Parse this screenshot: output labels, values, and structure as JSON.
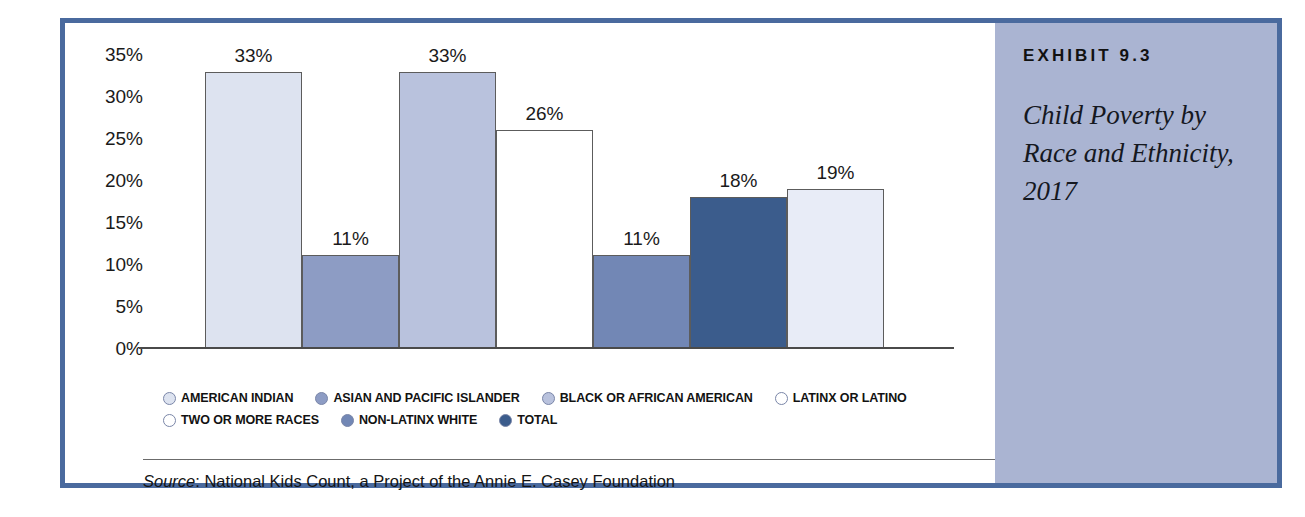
{
  "exhibit": {
    "label": "EXHIBIT 9.3",
    "title": "Child Poverty by Race and Ethnicity, 2017",
    "panel_color": "#aab4d2",
    "frame_color": "#4a6a9e"
  },
  "source": {
    "prefix": "Source",
    "separator": ": ",
    "text": "National Kids Count, a Project of the Annie E. Casey Foundation",
    "full": "Source: National Kids Count, a Project of the Annie E. Casey Foundation"
  },
  "legend": {
    "rows": [
      [
        {
          "label": "AMERICAN INDIAN",
          "color": "#dde3f0"
        },
        {
          "label": "ASIAN AND PACIFIC ISLANDER",
          "color": "#8d9cc4"
        },
        {
          "label": "BLACK OR AFRICAN AMERICAN",
          "color": "#b9c2dd"
        },
        {
          "label": "LATINX OR LATINO",
          "color": "#ffffff"
        }
      ],
      [
        {
          "label": "TWO OR MORE RACES",
          "color": "#ffffff"
        },
        {
          "label": "NON-LATINX WHITE",
          "color": "#7287b5"
        },
        {
          "label": "TOTAL",
          "color": "#3b5c8c"
        }
      ]
    ]
  },
  "chart_data": {
    "type": "bar",
    "title": "Child Poverty by Race and Ethnicity, 2017",
    "xlabel": "",
    "ylabel": "",
    "ylim": [
      0,
      35
    ],
    "ytick_labels": [
      "35%",
      "30%",
      "25%",
      "20%",
      "15%",
      "10%",
      "5%",
      "0%"
    ],
    "ytick_values": [
      35,
      30,
      25,
      20,
      15,
      10,
      5,
      0
    ],
    "grid": false,
    "legend_position": "below-plot",
    "value_label_suffix": "%",
    "categories": [
      "AMERICAN INDIAN",
      "ASIAN AND PACIFIC ISLANDER",
      "BLACK OR AFRICAN AMERICAN",
      "LATINX OR LATINO",
      "TWO OR MORE RACES",
      "NON-LATINX WHITE",
      "TOTAL"
    ],
    "values": [
      33,
      11,
      33,
      26,
      11,
      18,
      19
    ],
    "value_labels": [
      "33%",
      "11%",
      "33%",
      "26%",
      "11%",
      "18%",
      "19%"
    ],
    "colors": [
      "#dde3f0",
      "#8d9cc4",
      "#b9c2dd",
      "#ffffff",
      "#7287b5",
      "#3b5c8c",
      "#e8ecf7"
    ]
  }
}
